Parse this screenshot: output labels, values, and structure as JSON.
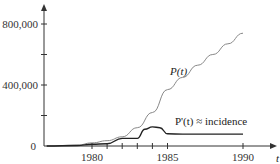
{
  "chart_data": {
    "type": "line",
    "title": "",
    "xlabel": "t",
    "ylabel": "",
    "xlim": [
      1975,
      1992
    ],
    "ylim": [
      0,
      900000
    ],
    "grid": false,
    "x_ticks": [
      1980,
      1981,
      1982,
      1983,
      1984,
      1985,
      1990
    ],
    "x_tick_labels": [
      "1980",
      "",
      "",
      "",
      "",
      "1985",
      "1990"
    ],
    "y_ticks": [
      0,
      200000,
      400000,
      600000,
      800000
    ],
    "y_tick_labels": [
      "0",
      "",
      "400,000",
      "",
      "800,000"
    ],
    "series": [
      {
        "name": "P(t)",
        "label": "P(t)",
        "color": "#888888",
        "x": [
          1977,
          1979,
          1980,
          1981,
          1982,
          1983,
          1984,
          1985,
          1986,
          1987,
          1988,
          1989,
          1990
        ],
        "values": [
          0,
          5000,
          20000,
          35000,
          60000,
          120000,
          220000,
          370000,
          450000,
          530000,
          600000,
          670000,
          740000
        ]
      },
      {
        "name": "P'(t) ≈ incidence",
        "label": "P'(t) ≈ incidence",
        "color": "#222222",
        "x": [
          1977,
          1979,
          1980,
          1981,
          1982,
          1982.5,
          1983,
          1983.5,
          1984,
          1984.5,
          1985,
          1986,
          1988,
          1990
        ],
        "values": [
          0,
          3000,
          12000,
          15000,
          50000,
          50000,
          50000,
          110000,
          125000,
          120000,
          80000,
          78000,
          78000,
          78000
        ]
      }
    ]
  }
}
